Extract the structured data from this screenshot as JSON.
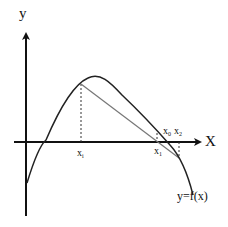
{
  "diagram": {
    "type": "function-root-approximation",
    "axes": {
      "x_label": "X",
      "y_label": "y"
    },
    "curve": {
      "label": "y=f(x)"
    },
    "points": {
      "xi": {
        "base": "x",
        "sub": "i"
      },
      "x1": {
        "base": "x",
        "sub": "1"
      },
      "x0": {
        "base": "x",
        "sub": "0"
      },
      "x2": {
        "base": "x",
        "sub": "2"
      }
    },
    "colors": {
      "axis": "#111111",
      "curve": "#222222",
      "chord": "#777777",
      "dotted": "#333333",
      "background": "#ffffff"
    }
  }
}
